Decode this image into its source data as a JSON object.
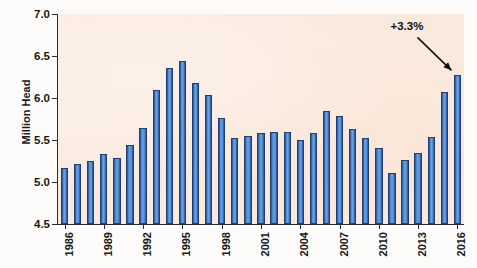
{
  "chart_data": {
    "type": "bar",
    "title": "",
    "xlabel": "",
    "ylabel": "Million Head",
    "ylim": [
      4.5,
      7.0
    ],
    "ytick_values": [
      4.5,
      5.0,
      5.5,
      6.0,
      6.5,
      7.0
    ],
    "ytick_labels": [
      "4.5",
      "5.0",
      "5.5",
      "6.0",
      "6.5",
      "7.0"
    ],
    "grid": false,
    "legend": "none",
    "bar_color": "#4a84cf",
    "bar_edge_color": "#1d3f72",
    "plot_background": "#faeade",
    "categories": [
      "1986",
      "1987",
      "1988",
      "1989",
      "1990",
      "1991",
      "1992",
      "1993",
      "1994",
      "1995",
      "1996",
      "1997",
      "1998",
      "1999",
      "2000",
      "2001",
      "2002",
      "2003",
      "2004",
      "2005",
      "2006",
      "2007",
      "2008",
      "2009",
      "2010",
      "2011",
      "2012",
      "2013",
      "2014",
      "2015",
      "2016"
    ],
    "xtick_labels": [
      "1986",
      "1989",
      "1992",
      "1995",
      "1998",
      "2001",
      "2004",
      "2007",
      "2010",
      "2013",
      "2016"
    ],
    "values": [
      5.17,
      5.21,
      5.25,
      5.33,
      5.28,
      5.44,
      5.64,
      6.09,
      6.36,
      6.44,
      6.18,
      6.04,
      5.76,
      5.52,
      5.55,
      5.58,
      5.6,
      5.6,
      5.5,
      5.58,
      5.85,
      5.79,
      5.63,
      5.52,
      5.41,
      5.11,
      5.26,
      5.34,
      5.54,
      6.07,
      6.27
    ],
    "annotations": [
      {
        "text": "+3.3%",
        "target_category": "2016",
        "target_value": 6.27
      }
    ]
  }
}
